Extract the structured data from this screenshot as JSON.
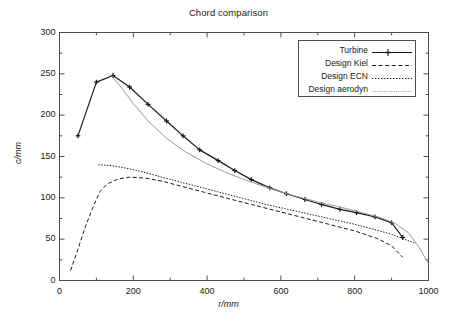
{
  "chart_data": {
    "type": "line",
    "title": "Chord comparison",
    "xlabel": "r/mm",
    "ylabel": "c/mm",
    "xlim": [
      0,
      1000
    ],
    "ylim": [
      0,
      300
    ],
    "xticks": [
      0,
      200,
      400,
      600,
      800,
      1000
    ],
    "yticks": [
      0,
      50,
      100,
      150,
      200,
      250,
      300
    ],
    "grid": false,
    "legend_position": "top-right",
    "series": [
      {
        "name": "Turbine",
        "style": "solid-with-plus-markers",
        "color": "#1a1a1a",
        "x": [
          50,
          100,
          145,
          190,
          240,
          290,
          335,
          380,
          430,
          475,
          520,
          570,
          615,
          665,
          710,
          760,
          805,
          855,
          900,
          930
        ],
        "y": [
          175,
          240,
          248,
          234,
          213,
          193,
          175,
          158,
          145,
          133,
          122,
          112,
          105,
          98,
          92,
          86,
          82,
          77,
          70,
          52
        ]
      },
      {
        "name": "Design Kiel",
        "style": "dashed",
        "color": "#1a1a1a",
        "x": [
          30,
          50,
          70,
          90,
          110,
          130,
          160,
          190,
          230,
          280,
          330,
          390,
          450,
          520,
          590,
          660,
          730,
          800,
          860,
          900,
          930
        ],
        "y": [
          12,
          38,
          65,
          88,
          108,
          117,
          123,
          125,
          124,
          120,
          114,
          107,
          100,
          92,
          84,
          76,
          68,
          60,
          51,
          42,
          28
        ]
      },
      {
        "name": "Design ECN",
        "style": "dotted",
        "color": "#1a1a1a",
        "x": [
          105,
          140,
          180,
          220,
          270,
          320,
          380,
          440,
          500,
          560,
          620,
          680,
          740,
          800,
          850,
          900,
          940,
          965
        ],
        "y": [
          140,
          139,
          136,
          132,
          126,
          120,
          113,
          106,
          99,
          92,
          86,
          80,
          74,
          68,
          62,
          56,
          49,
          45
        ]
      },
      {
        "name": "Design aerodyn",
        "style": "fine-dotted-light",
        "color": "#999999",
        "x": [
          140,
          170,
          200,
          240,
          290,
          340,
          400,
          460,
          520,
          580,
          640,
          700,
          760,
          820,
          870,
          910,
          945,
          975,
          1000
        ],
        "y": [
          248,
          232,
          214,
          193,
          172,
          156,
          141,
          129,
          119,
          110,
          102,
          95,
          89,
          82,
          76,
          69,
          58,
          40,
          20
        ]
      }
    ]
  },
  "legend": {
    "items": [
      {
        "label": "Turbine"
      },
      {
        "label": "Design Kiel"
      },
      {
        "label": "Design ECN"
      },
      {
        "label": "Design aerodyn"
      }
    ]
  },
  "axes": {
    "x_tick_labels": [
      "0",
      "200",
      "400",
      "600",
      "800",
      "1000"
    ],
    "y_tick_labels": [
      "0",
      "50",
      "100",
      "150",
      "200",
      "250",
      "300"
    ],
    "x_title": "r/mm",
    "y_title": "c/mm"
  }
}
